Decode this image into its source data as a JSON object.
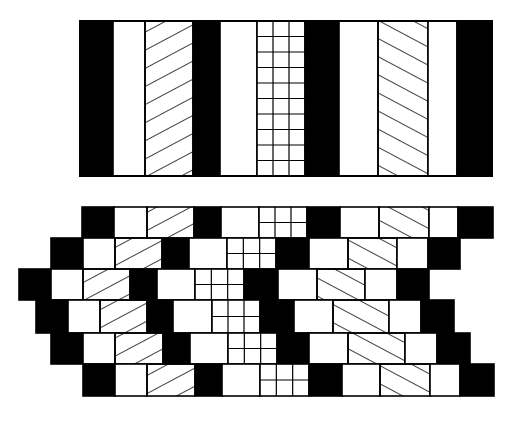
{
  "colors": {
    "ink": "#000000",
    "paper": "#ffffff"
  },
  "pattern_legend": {
    "black": "solid black stripe",
    "white": "empty white stripe",
    "hatch-fwd": "diagonal hatch rising to the right (/)",
    "hatch-back": "diagonal hatch falling to the right (\\)",
    "grid": "square grid"
  },
  "top_strip": {
    "y": 21,
    "height": 155,
    "grid_rows": 10,
    "grid_cols": 3,
    "columns": [
      {
        "type": "black",
        "x0": 80,
        "x1": 113
      },
      {
        "type": "white",
        "x0": 113,
        "x1": 145
      },
      {
        "type": "hatch-fwd",
        "x0": 145,
        "x1": 193
      },
      {
        "type": "black",
        "x0": 193,
        "x1": 220
      },
      {
        "type": "white",
        "x0": 220,
        "x1": 257
      },
      {
        "type": "grid",
        "x0": 257,
        "x1": 305
      },
      {
        "type": "black",
        "x0": 305,
        "x1": 339
      },
      {
        "type": "white",
        "x0": 339,
        "x1": 378
      },
      {
        "type": "hatch-back",
        "x0": 378,
        "x1": 428
      },
      {
        "type": "white",
        "x0": 428,
        "x1": 457
      },
      {
        "type": "black",
        "x0": 457,
        "x1": 492
      }
    ]
  },
  "staggered_rows": {
    "grid_rows": 2,
    "grid_cols": 3,
    "rows": [
      {
        "y0": 207,
        "y1": 238,
        "bounds": [
          82,
          114,
          147,
          194,
          221,
          259,
          307,
          340,
          379,
          429,
          458,
          493
        ]
      },
      {
        "y0": 238,
        "y1": 269,
        "bounds": [
          51,
          83,
          115,
          162,
          189,
          227,
          276,
          309,
          348,
          397,
          428,
          460
        ]
      },
      {
        "y0": 269,
        "y1": 300,
        "bounds": [
          19,
          51,
          83,
          130,
          157,
          195,
          244,
          278,
          317,
          365,
          397,
          429
        ]
      },
      {
        "y0": 300,
        "y1": 333,
        "bounds": [
          36,
          68,
          100,
          147,
          173,
          212,
          260,
          294,
          333,
          389,
          421,
          454
        ]
      },
      {
        "y0": 333,
        "y1": 364,
        "bounds": [
          51,
          83,
          115,
          163,
          190,
          228,
          277,
          309,
          348,
          405,
          437,
          470
        ]
      },
      {
        "y0": 364,
        "y1": 396,
        "bounds": [
          83,
          115,
          147,
          195,
          222,
          260,
          309,
          342,
          380,
          430,
          460,
          494
        ]
      }
    ],
    "column_types": [
      "black",
      "white",
      "hatch-fwd",
      "black",
      "white",
      "grid",
      "black",
      "white",
      "hatch-back",
      "white",
      "black"
    ]
  }
}
